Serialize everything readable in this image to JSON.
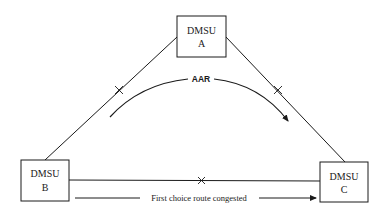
{
  "diagram": {
    "nodes": [
      {
        "id": "A",
        "line1": "DMSU",
        "line2": "A"
      },
      {
        "id": "B",
        "line1": "DMSU",
        "line2": "B"
      },
      {
        "id": "C",
        "line1": "DMSU",
        "line2": "C"
      }
    ],
    "links": [
      {
        "from": "A",
        "to": "B",
        "marker": "congestion-cross"
      },
      {
        "from": "A",
        "to": "C",
        "marker": "congestion-cross"
      },
      {
        "from": "B",
        "to": "C",
        "marker": "congestion-cross"
      }
    ],
    "aar_label": "AAR",
    "route_label": "First choice route congested",
    "colors": {
      "line": "#1a1a1a",
      "background": "#ffffff"
    }
  }
}
